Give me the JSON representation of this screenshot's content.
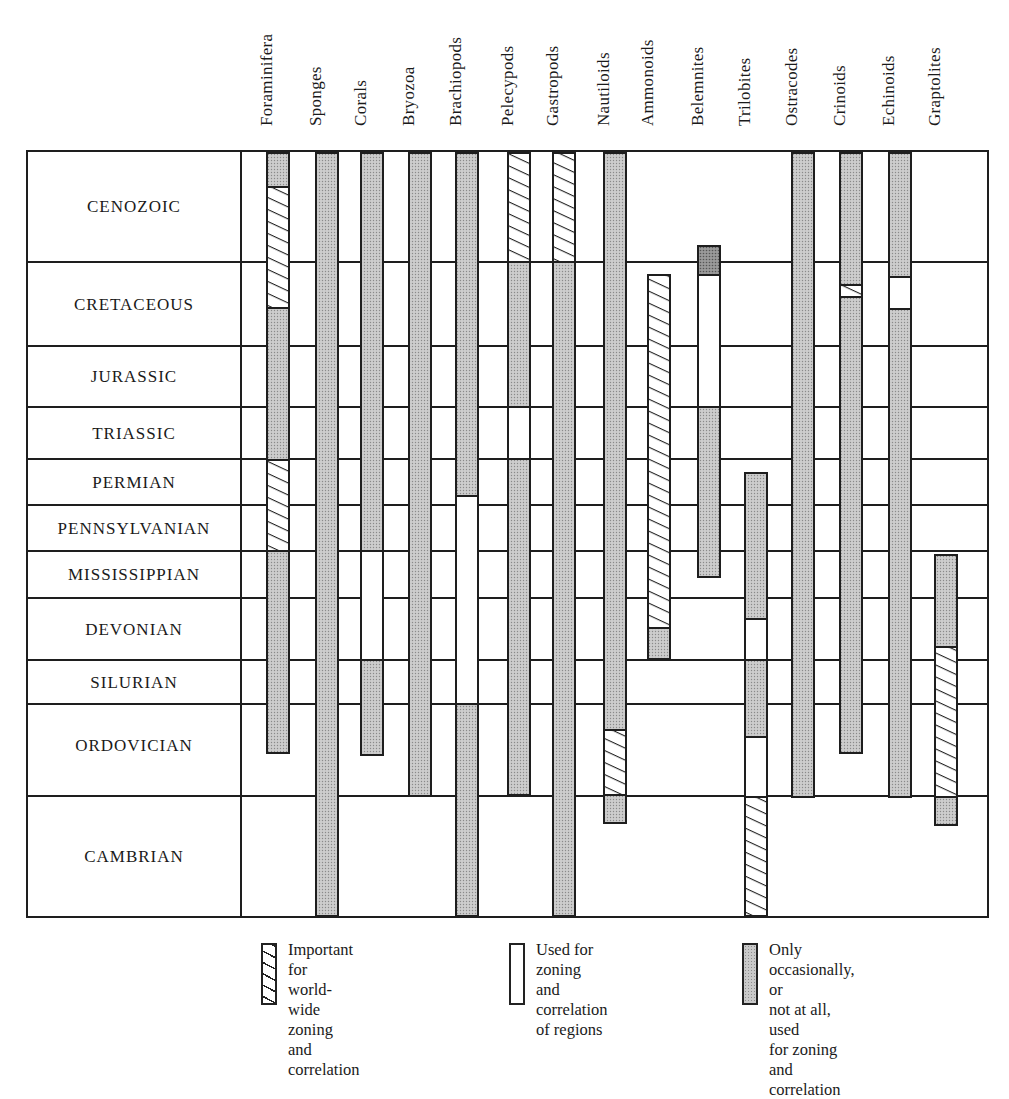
{
  "chart_data": {
    "type": "range-bar",
    "title": "",
    "xlabel": "Fossil groups",
    "ylabel": "Geologic periods",
    "grid": true,
    "legend_position": "bottom",
    "periods": [
      "CENOZOIC",
      "CRETACEOUS",
      "JURASSIC",
      "TRIASSIC",
      "PERMIAN",
      "PENNSYLVANIAN",
      "MISSISSIPPIAN",
      "DEVONIAN",
      "SILURIAN",
      "ORDOVICIAN",
      "CAMBRIAN"
    ],
    "categories": [
      "Foraminifera",
      "Sponges",
      "Corals",
      "Bryozoa",
      "Brachiopods",
      "Pelecypods",
      "Gastropods",
      "Nautiloids",
      "Ammonoids",
      "Belemnites",
      "Trilobites",
      "Ostracodes",
      "Crinoids",
      "Echinoids",
      "Graptolites"
    ],
    "legend": [
      {
        "key": "hatch",
        "label": "Important for\nworld-wide zoning\nand correlation"
      },
      {
        "key": "white",
        "label": "Used for zoning\nand correlation\nof regions"
      },
      {
        "key": "stipple",
        "label": "Only occasionally, or\nnot at all, used\nfor zoning and\ncorrelation"
      }
    ],
    "series": [
      {
        "name": "Foraminifera",
        "segments": [
          {
            "from": "Cenozoic (top)",
            "to": "Cenozoic (upper)",
            "type": "stipple"
          },
          {
            "from": "Cenozoic",
            "to": "Cretaceous (mid)",
            "type": "hatch"
          },
          {
            "from": "Cretaceous (mid)",
            "to": "Permian",
            "type": "stipple"
          },
          {
            "from": "Permian",
            "to": "Pennsylvanian",
            "type": "hatch"
          },
          {
            "from": "Mississippian",
            "to": "Ordovician (mid)",
            "type": "stipple"
          }
        ]
      },
      {
        "name": "Sponges",
        "segments": [
          {
            "from": "Cenozoic",
            "to": "Cambrian",
            "type": "stipple"
          }
        ]
      },
      {
        "name": "Corals",
        "segments": [
          {
            "from": "Cenozoic",
            "to": "Pennsylvanian",
            "type": "stipple"
          },
          {
            "from": "Mississippian",
            "to": "Devonian",
            "type": "white"
          },
          {
            "from": "Silurian",
            "to": "Ordovician (mid)",
            "type": "stipple"
          }
        ]
      },
      {
        "name": "Bryozoa",
        "segments": [
          {
            "from": "Cenozoic",
            "to": "Ordovician",
            "type": "stipple"
          }
        ]
      },
      {
        "name": "Brachiopods",
        "segments": [
          {
            "from": "Cenozoic",
            "to": "Permian",
            "type": "stipple"
          },
          {
            "from": "Pennsylvanian",
            "to": "Silurian",
            "type": "white"
          },
          {
            "from": "Ordovician",
            "to": "Cambrian",
            "type": "stipple"
          }
        ]
      },
      {
        "name": "Pelecypods",
        "segments": [
          {
            "from": "Cenozoic",
            "to": "Cenozoic",
            "type": "hatch"
          },
          {
            "from": "Cretaceous",
            "to": "Jurassic",
            "type": "stipple"
          },
          {
            "from": "Triassic",
            "to": "Triassic",
            "type": "white"
          },
          {
            "from": "Permian",
            "to": "Ordovician",
            "type": "stipple"
          }
        ]
      },
      {
        "name": "Gastropods",
        "segments": [
          {
            "from": "Cenozoic",
            "to": "Cenozoic",
            "type": "hatch"
          },
          {
            "from": "Cretaceous",
            "to": "Cambrian",
            "type": "stipple"
          }
        ]
      },
      {
        "name": "Nautiloids",
        "segments": [
          {
            "from": "Cenozoic",
            "to": "Ordovician (upper)",
            "type": "stipple"
          },
          {
            "from": "Ordovician (upper)",
            "to": "Ordovician",
            "type": "hatch"
          },
          {
            "from": "Cambrian (upper)",
            "to": "Cambrian (upper)",
            "type": "stipple"
          }
        ]
      },
      {
        "name": "Ammonoids",
        "segments": [
          {
            "from": "Cretaceous",
            "to": "Devonian (mid)",
            "type": "hatch"
          },
          {
            "from": "Devonian (mid)",
            "to": "Devonian",
            "type": "stipple"
          }
        ]
      },
      {
        "name": "Belemnites",
        "segments": [
          {
            "from": "Cenozoic (base)",
            "to": "Cretaceous (top)",
            "type": "stipple-dark"
          },
          {
            "from": "Cretaceous",
            "to": "Jurassic",
            "type": "white"
          },
          {
            "from": "Triassic",
            "to": "Mississippian (mid)",
            "type": "stipple"
          }
        ]
      },
      {
        "name": "Trilobites",
        "segments": [
          {
            "from": "Permian (top)",
            "to": "Devonian (mid)",
            "type": "stipple"
          },
          {
            "from": "Devonian (mid)",
            "to": "Devonian",
            "type": "white"
          },
          {
            "from": "Silurian",
            "to": "Ordovician (mid)",
            "type": "stipple"
          },
          {
            "from": "Ordovician (mid)",
            "to": "Ordovician",
            "type": "white"
          },
          {
            "from": "Cambrian",
            "to": "Cambrian",
            "type": "hatch"
          }
        ]
      },
      {
        "name": "Ostracodes",
        "segments": [
          {
            "from": "Cenozoic",
            "to": "Ordovician",
            "type": "stipple"
          }
        ]
      },
      {
        "name": "Crinoids",
        "segments": [
          {
            "from": "Cenozoic",
            "to": "Cretaceous (upper)",
            "type": "stipple"
          },
          {
            "from": "Cretaceous (upper)",
            "to": "Cretaceous (upper)",
            "type": "hatch"
          },
          {
            "from": "Cretaceous (upper)",
            "to": "Ordovician (mid)",
            "type": "stipple"
          }
        ]
      },
      {
        "name": "Echinoids",
        "segments": [
          {
            "from": "Cenozoic",
            "to": "Cretaceous (upper)",
            "type": "stipple"
          },
          {
            "from": "Cretaceous (upper)",
            "to": "Cretaceous (mid)",
            "type": "white"
          },
          {
            "from": "Cretaceous (mid)",
            "to": "Ordovician",
            "type": "stipple"
          }
        ]
      },
      {
        "name": "Graptolites",
        "segments": [
          {
            "from": "Mississippian",
            "to": "Devonian",
            "type": "stipple"
          },
          {
            "from": "Silurian",
            "to": "Ordovician",
            "type": "hatch"
          },
          {
            "from": "Cambrian (upper)",
            "to": "Cambrian (upper)",
            "type": "stipple"
          }
        ]
      }
    ]
  },
  "layout": {
    "box": {
      "left": 27,
      "right": 988,
      "top": 151,
      "bottom": 917,
      "label_col_right": 241
    },
    "period_bounds": [
      151,
      262,
      346,
      407,
      459,
      505,
      551,
      598,
      660,
      704,
      796,
      917
    ],
    "columns": [
      {
        "x": 267,
        "segs": [
          [
            153,
            187,
            "stipple"
          ],
          [
            187,
            308,
            "hatch"
          ],
          [
            308,
            460,
            "stipple"
          ],
          [
            460,
            551,
            "hatch"
          ],
          [
            551,
            753,
            "stipple"
          ]
        ]
      },
      {
        "x": 316,
        "segs": [
          [
            153,
            916,
            "stipple"
          ]
        ]
      },
      {
        "x": 361,
        "segs": [
          [
            153,
            551,
            "stipple"
          ],
          [
            551,
            660,
            "white"
          ],
          [
            660,
            755,
            "stipple"
          ]
        ]
      },
      {
        "x": 409,
        "segs": [
          [
            153,
            796,
            "stipple"
          ]
        ]
      },
      {
        "x": 456,
        "segs": [
          [
            153,
            496,
            "stipple"
          ],
          [
            496,
            704,
            "white"
          ],
          [
            704,
            916,
            "stipple"
          ]
        ]
      },
      {
        "x": 508,
        "segs": [
          [
            153,
            262,
            "hatch"
          ],
          [
            262,
            407,
            "stipple"
          ],
          [
            407,
            459,
            "white"
          ],
          [
            459,
            795,
            "stipple"
          ]
        ]
      },
      {
        "x": 553,
        "segs": [
          [
            153,
            262,
            "hatch"
          ],
          [
            262,
            916,
            "stipple"
          ]
        ]
      },
      {
        "x": 604,
        "segs": [
          [
            153,
            730,
            "stipple"
          ],
          [
            730,
            795,
            "hatch"
          ],
          [
            795,
            823,
            "stipple"
          ]
        ]
      },
      {
        "x": 648,
        "segs": [
          [
            275,
            628,
            "hatch"
          ],
          [
            628,
            659,
            "stipple"
          ]
        ]
      },
      {
        "x": 698,
        "segs": [
          [
            246,
            275,
            "dark"
          ],
          [
            275,
            407,
            "white"
          ],
          [
            407,
            577,
            "stipple"
          ]
        ]
      },
      {
        "x": 745,
        "segs": [
          [
            473,
            619,
            "stipple"
          ],
          [
            619,
            660,
            "white"
          ],
          [
            660,
            737,
            "stipple"
          ],
          [
            737,
            797,
            "white"
          ],
          [
            797,
            916,
            "hatch"
          ]
        ]
      },
      {
        "x": 792,
        "segs": [
          [
            153,
            797,
            "stipple"
          ]
        ]
      },
      {
        "x": 840,
        "segs": [
          [
            153,
            285,
            "stipple"
          ],
          [
            285,
            297,
            "hatch"
          ],
          [
            297,
            753,
            "stipple"
          ]
        ]
      },
      {
        "x": 889,
        "segs": [
          [
            153,
            277,
            "stipple"
          ],
          [
            277,
            309,
            "white"
          ],
          [
            309,
            797,
            "stipple"
          ]
        ]
      },
      {
        "x": 935,
        "segs": [
          [
            555,
            647,
            "stipple"
          ],
          [
            647,
            797,
            "hatch"
          ],
          [
            797,
            825,
            "stipple"
          ]
        ]
      }
    ],
    "bar_width": 22,
    "colors": {
      "line": "#1e1e1e",
      "stipple": "#c9c9c9",
      "dark": "#8a8a8a",
      "paper": "#ffffff"
    }
  }
}
